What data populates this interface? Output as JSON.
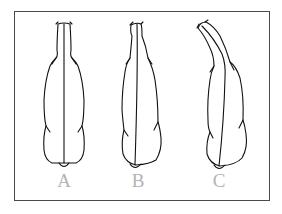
{
  "figure": {
    "frame_color": "#4a4a4a",
    "stroke_color": "#111111",
    "label_color": "#b4b4b4",
    "panels": [
      {
        "id": "A",
        "label": "A",
        "description": "straight, symmetric elongated shape with central line"
      },
      {
        "id": "B",
        "label": "B",
        "description": "slightly tilted elongated shape with oblique central line"
      },
      {
        "id": "C",
        "label": "C",
        "description": "elongated shape with neck curved to upper left"
      }
    ]
  }
}
